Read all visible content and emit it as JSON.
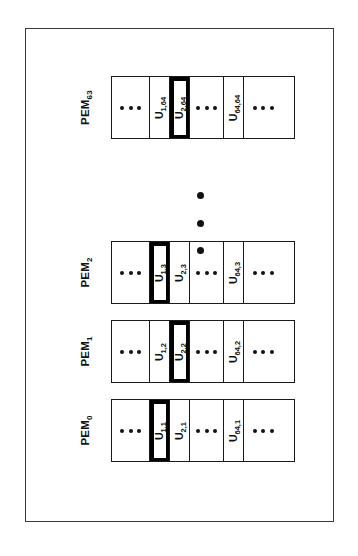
{
  "figure": {
    "rows": [
      {
        "label_base": "PEM",
        "label_sub": "63",
        "name": "pem-63",
        "cells": [
          {
            "kind": "ellipsis",
            "text": "..."
          },
          {
            "kind": "label",
            "base": "U",
            "sub": "1,64",
            "highlight": false
          },
          {
            "kind": "label",
            "base": "U",
            "sub": "2,64",
            "highlight": true
          },
          {
            "kind": "ellipsis",
            "text": "..."
          },
          {
            "kind": "label",
            "base": "U",
            "sub": "64,64",
            "highlight": false
          },
          {
            "kind": "ellipsis",
            "text": "..."
          }
        ]
      },
      {
        "label_base": "PEM",
        "label_sub": "2",
        "name": "pem-2",
        "cells": [
          {
            "kind": "ellipsis",
            "text": "..."
          },
          {
            "kind": "label",
            "base": "U",
            "sub": "1,3",
            "highlight": true
          },
          {
            "kind": "label",
            "base": "U",
            "sub": "2,3",
            "highlight": false
          },
          {
            "kind": "ellipsis",
            "text": "..."
          },
          {
            "kind": "label",
            "base": "U",
            "sub": "64,3",
            "highlight": false
          },
          {
            "kind": "ellipsis",
            "text": "..."
          }
        ]
      },
      {
        "label_base": "PEM",
        "label_sub": "1",
        "name": "pem-1",
        "cells": [
          {
            "kind": "ellipsis",
            "text": "..."
          },
          {
            "kind": "label",
            "base": "U",
            "sub": "1,2",
            "highlight": false
          },
          {
            "kind": "label",
            "base": "U",
            "sub": "2,2",
            "highlight": true
          },
          {
            "kind": "ellipsis",
            "text": "..."
          },
          {
            "kind": "label",
            "base": "U",
            "sub": "64,2",
            "highlight": false
          },
          {
            "kind": "ellipsis",
            "text": "..."
          }
        ]
      },
      {
        "label_base": "PEM",
        "label_sub": "0",
        "name": "pem-0",
        "cells": [
          {
            "kind": "ellipsis",
            "text": "..."
          },
          {
            "kind": "label",
            "base": "U",
            "sub": "1,1",
            "highlight": true
          },
          {
            "kind": "label",
            "base": "U",
            "sub": "2,1",
            "highlight": false
          },
          {
            "kind": "ellipsis",
            "text": "..."
          },
          {
            "kind": "label",
            "base": "U",
            "sub": "64,1",
            "highlight": false
          },
          {
            "kind": "ellipsis",
            "text": "..."
          }
        ]
      }
    ],
    "vertical_ellipsis_dots": 3,
    "colors": {
      "frame": "#3a3a3a",
      "cell_border": "#1a1a1a",
      "highlight_fill": "#000000",
      "background": "#ffffff",
      "text": "#111111"
    }
  }
}
